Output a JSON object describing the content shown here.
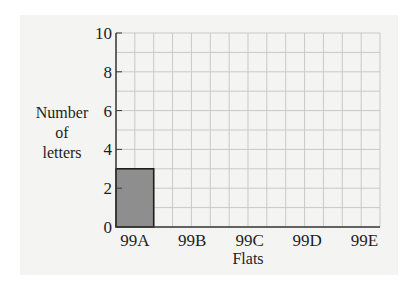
{
  "chart_data": {
    "type": "bar",
    "title": "",
    "xlabel": "Flats",
    "ylabel": [
      "Number",
      "of",
      "letters"
    ],
    "categories": [
      "99A",
      "99B",
      "99C",
      "99D",
      "99E"
    ],
    "values": [
      3,
      null,
      null,
      null,
      null
    ],
    "ylim": [
      0,
      10
    ],
    "yticks": [
      0,
      2,
      4,
      6,
      8,
      10
    ],
    "grid": true,
    "grid_minor_y": 1,
    "x_grid_columns": 14,
    "legend": null
  },
  "colors": {
    "panel": "#f4f4f3",
    "grid": "#c9c9c9",
    "axis": "#3a3a3a",
    "bar_fill": "#8e8e8e",
    "bar_stroke": "#1e1e1e"
  }
}
